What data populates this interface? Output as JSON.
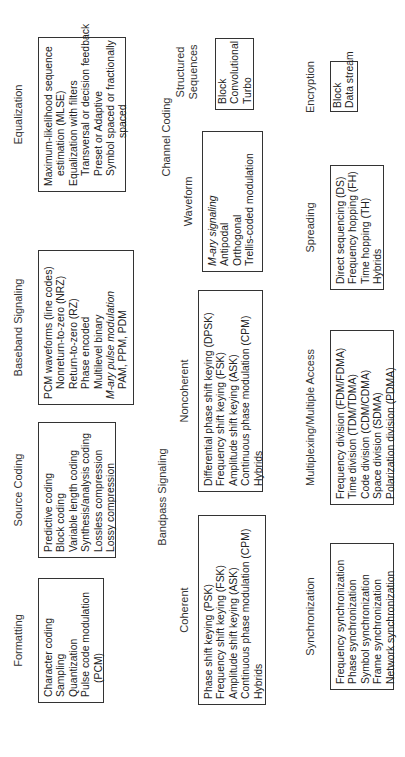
{
  "diagram": {
    "columns": [
      {
        "row": 1,
        "categories": [
          {
            "title": "Formatting",
            "items": [
              "Character coding",
              "Sampling",
              "Quantization",
              "Pulse code modulation",
              "(PCM)"
            ]
          },
          {
            "title": "Source Coding",
            "items": [
              "Predictive coding",
              "Block coding",
              "Variable length coding",
              "Synthesis/analysis coding",
              "Lossless compression",
              "Lossy compression"
            ]
          },
          {
            "title": "Baseband Signaling",
            "items": [
              "PCM waveforms (line codes)",
              "Nonreturn-to-zero (NRZ)",
              "Return-to-zero (RZ)",
              "Phase encoded",
              "Multilevel binary",
              "M-ary pulse modulation",
              "PAM, PPM, PDM"
            ]
          },
          {
            "title": "Equalization",
            "items": [
              "Maximum-likelihood sequence",
              "estimation (MLSE)",
              "Equalization with filters",
              "Transversal or decision feedback",
              "Preset or Adaptive",
              "Symbol spaced or fractionally",
              "spaced"
            ]
          }
        ]
      },
      {
        "row": 2,
        "groups": [
          {
            "title": "Bandpass Signaling",
            "subcategories": [
              {
                "title": "Coherent",
                "items": [
                  "Phase shift keying (PSK)",
                  "Frequency shift keying (FSK)",
                  "Amplitude shift keying (ASK)",
                  "Continuous phase modulation (CPM)",
                  "Hybrids"
                ]
              },
              {
                "title": "Noncoherent",
                "items": [
                  "Differential phase shift keying (DPSK)",
                  "Frequency shift keying (FSK)",
                  "Amplitude shift keying (ASK)",
                  "Continuous phase modulation (CPM)",
                  "Hybrids"
                ]
              }
            ]
          },
          {
            "title": "Channel Coding",
            "subcategories": [
              {
                "title": "Waveform",
                "items": [
                  "M-ary signaling",
                  "Antipodal",
                  "Orthogonal",
                  "Trellis-coded modulation"
                ]
              },
              {
                "title_lines": [
                  "Structured",
                  "Sequences"
                ],
                "items": [
                  "Block",
                  "Convolutional",
                  "Turbo"
                ]
              }
            ]
          }
        ]
      },
      {
        "row": 3,
        "categories": [
          {
            "title": "Synchronization",
            "items": [
              "Frequency synchronization",
              "Phase synchronization",
              "Symbol synchronization",
              "Frame synchronization",
              "Network synchronization"
            ]
          },
          {
            "title": "Multiplexing/Multiple Access",
            "items": [
              "Frequency division (FDM/FDMA)",
              "Time division (TDM/TDMA)",
              "Code division (CDM/CDMA)",
              "Space division (SDMA)",
              "Polarization division (PDMA)"
            ]
          },
          {
            "title": "Spreading",
            "items": [
              "Direct sequencing (DS)",
              "Frequency hopping (FH)",
              "Time hopping (TH)",
              "Hybrids"
            ]
          },
          {
            "title": "Encryption",
            "items": [
              "Block",
              "Data stream"
            ]
          }
        ]
      }
    ],
    "colors": {
      "background": "#ffffff",
      "border": "#333333",
      "text": "#222222"
    },
    "orientation": "rotated-90-ccw"
  }
}
